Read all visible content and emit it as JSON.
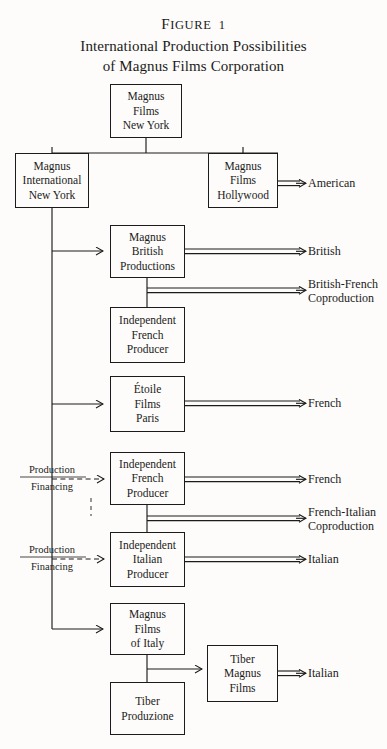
{
  "figure": {
    "label_small_caps": "F",
    "label": "IGURE",
    "number": "1",
    "label_full": "Figure 1",
    "title_line1": "International Production Possibilities",
    "title_line2": "of Magnus Films Corporation"
  },
  "colors": {
    "ink": "#1b1b1b",
    "paper": "#fdfcfa"
  },
  "boxes": [
    {
      "id": "magnus-films-new-york",
      "lines": [
        "Magnus",
        "Films",
        "New York"
      ]
    },
    {
      "id": "magnus-international-new-york",
      "lines": [
        "Magnus",
        "International",
        "New York"
      ]
    },
    {
      "id": "magnus-films-hollywood",
      "lines": [
        "Magnus",
        "Films",
        "Hollywood"
      ]
    },
    {
      "id": "magnus-british-productions",
      "lines": [
        "Magnus",
        "British",
        "Productions"
      ]
    },
    {
      "id": "independent-french-producer-1",
      "lines": [
        "Independent",
        "French",
        "Producer"
      ]
    },
    {
      "id": "etoile-films-paris",
      "lines": [
        "Étoile",
        "Films",
        "Paris"
      ]
    },
    {
      "id": "independent-french-producer-2",
      "lines": [
        "Independent",
        "French",
        "Producer"
      ]
    },
    {
      "id": "independent-italian-producer",
      "lines": [
        "Independent",
        "Italian",
        "Producer"
      ]
    },
    {
      "id": "magnus-films-of-italy",
      "lines": [
        "Magnus",
        "Films",
        "of Italy"
      ]
    },
    {
      "id": "tiber-magnus-films",
      "lines": [
        "Tiber",
        "Magnus",
        "Films"
      ]
    },
    {
      "id": "tiber-produzione",
      "lines": [
        "Tiber",
        "Produzione"
      ]
    }
  ],
  "outputs": [
    {
      "id": "american",
      "lines": [
        "American"
      ]
    },
    {
      "id": "british",
      "lines": [
        "British"
      ]
    },
    {
      "id": "british-french",
      "lines": [
        "British-French",
        "Coproduction"
      ]
    },
    {
      "id": "french-etoile",
      "lines": [
        "French"
      ]
    },
    {
      "id": "french-independent",
      "lines": [
        "French"
      ]
    },
    {
      "id": "french-italian",
      "lines": [
        "French-Italian",
        "Coproduction"
      ]
    },
    {
      "id": "italian-independent",
      "lines": [
        "Italian"
      ]
    },
    {
      "id": "italian-tiber-magnus",
      "lines": [
        "Italian"
      ]
    }
  ],
  "financing_tags": [
    {
      "id": "production-financing-french",
      "top": "Production",
      "bottom": "Financing"
    },
    {
      "id": "production-financing-italian",
      "top": "Production",
      "bottom": "Financing"
    }
  ]
}
